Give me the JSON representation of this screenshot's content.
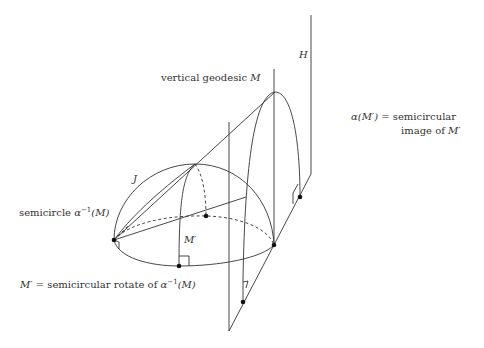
{
  "labels": {
    "H": "H",
    "vertical_geodesic_text": "vertical geodesic ",
    "vertical_geodesic_var": "M",
    "J": "J",
    "semicircle_text": "semicircle ",
    "semicircle_alpha": "α",
    "semicircle_sup": "−1",
    "semicircle_arg": "(M)",
    "M_prime": "M′",
    "rotate_lhs": "M′",
    "rotate_text": " = semicircular rotate of ",
    "rotate_alpha": "α",
    "rotate_sup": "−1",
    "rotate_arg": "(M)",
    "image_lhs": "α(M′)",
    "image_text1": " = semicircular",
    "image_text2": "image of ",
    "image_var": "M′"
  },
  "colors": {
    "stroke": "#333333",
    "dot": "#111111",
    "text": "#333333"
  }
}
